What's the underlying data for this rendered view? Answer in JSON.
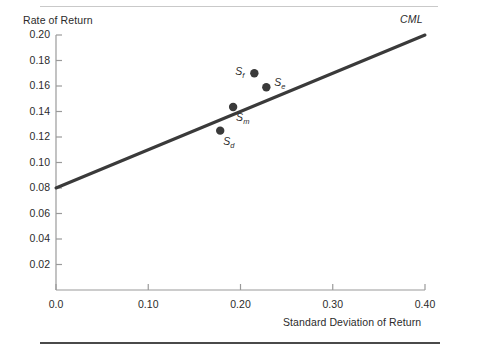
{
  "figure": {
    "background_color": "#ffffff",
    "ink_color": "#3a3a3a",
    "top_rule_color": "#c9c9c9",
    "bottom_rule_color": "#4a4a4a"
  },
  "chart_data": {
    "type": "scatter",
    "title": "",
    "subtitle": "",
    "xlabel": "Standard Deviation of Return",
    "ylabel": "Rate of Return",
    "xlim": [
      0.0,
      0.4
    ],
    "ylim": [
      0.0,
      0.2
    ],
    "grid": false,
    "legend": "none",
    "xticks": [
      "0.0",
      "0.10",
      "0.20",
      "0.30",
      "0.40"
    ],
    "xtick_values": [
      0.0,
      0.1,
      0.2,
      0.3,
      0.4
    ],
    "yticks": [
      "0.02",
      "0.04",
      "0.06",
      "0.08",
      "0.10",
      "0.12",
      "0.14",
      "0.16",
      "0.18",
      "0.20"
    ],
    "ytick_values": [
      0.02,
      0.04,
      0.06,
      0.08,
      0.1,
      0.12,
      0.14,
      0.16,
      0.18,
      0.2
    ],
    "series": [
      {
        "name": "CML",
        "type": "line",
        "label": "CML",
        "intercept": 0.08,
        "slope": 0.3,
        "x": [
          0.0,
          0.4
        ],
        "values": [
          0.08,
          0.2
        ]
      },
      {
        "name": "portfolios",
        "type": "scatter",
        "points": [
          {
            "label": "S",
            "subscript": "f",
            "x": 0.215,
            "y": 0.17,
            "label_position": "left"
          },
          {
            "label": "S",
            "subscript": "e",
            "x": 0.228,
            "y": 0.159,
            "label_position": "right"
          },
          {
            "label": "S",
            "subscript": "m",
            "x": 0.192,
            "y": 0.1435,
            "label_position": "below-right"
          },
          {
            "label": "S",
            "subscript": "d",
            "x": 0.178,
            "y": 0.125,
            "label_position": "below-right"
          }
        ]
      }
    ],
    "annotations": [
      {
        "text": "CML",
        "x": 0.4,
        "y": 0.205,
        "style": "italic"
      }
    ]
  }
}
